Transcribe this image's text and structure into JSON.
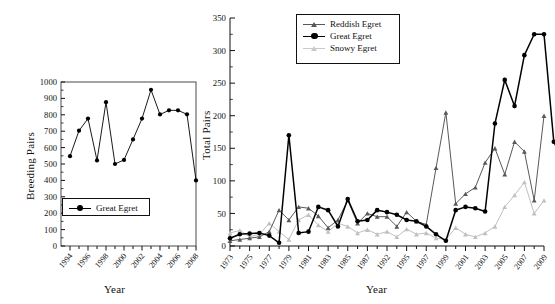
{
  "figure": {
    "background": "#ffffff"
  },
  "left_panel": {
    "ylabel": "Breeding Pairs",
    "xlabel": "Year",
    "legend": [
      {
        "label": "Great Egret",
        "color": "#000000",
        "marker": "circle"
      }
    ]
  },
  "right_panel": {
    "ylabel": "Total Pairs",
    "xlabel": "Year",
    "legend": [
      {
        "label": "Reddish Egret",
        "color": "#595959",
        "marker": "triangle"
      },
      {
        "label": "Great Egret",
        "color": "#000000",
        "marker": "circle"
      },
      {
        "label": "Snowy Egret",
        "color": "#c0c0c0",
        "marker": "triangle"
      }
    ]
  },
  "chart_data": [
    {
      "type": "line",
      "title": "",
      "xlabel": "Year",
      "ylabel": "Breeding Pairs",
      "ylim": [
        0,
        1000
      ],
      "ytick_step": 100,
      "yticks": [
        0,
        100,
        200,
        300,
        400,
        500,
        600,
        700,
        800,
        900,
        1000
      ],
      "xlim": [
        1993,
        2008
      ],
      "xticks": [
        1994,
        1995,
        1996,
        1997,
        1998,
        1999,
        2000,
        2001,
        2002,
        2003,
        2004,
        2005,
        2006,
        2007,
        2008
      ],
      "xtick_labels": [
        "1994",
        "",
        "1996",
        "",
        "1998",
        "",
        "2000",
        "",
        "2002",
        "",
        "2004",
        "",
        "2006",
        "",
        "2008"
      ],
      "grid": false,
      "legend_position": "lower-center-inside",
      "series": [
        {
          "name": "Great Egret",
          "color": "#000000",
          "marker": "circle",
          "x": [
            1994,
            1995,
            1996,
            1997,
            1998,
            1999,
            2000,
            2001,
            2002,
            2003,
            2004,
            2005,
            2006,
            2007,
            2008
          ],
          "values": [
            548,
            703,
            777,
            522,
            877,
            500,
            525,
            650,
            777,
            952,
            802,
            827,
            827,
            803,
            400
          ]
        }
      ]
    },
    {
      "type": "line",
      "title": "",
      "xlabel": "Year",
      "ylabel": "Total Pairs",
      "ylim": [
        0,
        350
      ],
      "ytick_step": 50,
      "yticks": [
        0,
        50,
        100,
        150,
        200,
        250,
        300,
        350
      ],
      "grid": false,
      "legend_position": "upper-center-inside",
      "xtick_labels": [
        "1973",
        "1975",
        "1977",
        "1979",
        "1981",
        "1983",
        "1985",
        "1987",
        "1992",
        "1995",
        "1997",
        "1999",
        "2001",
        "2003",
        "2005",
        "2007",
        "2009"
      ],
      "x": [
        "1973",
        "1974",
        "1975",
        "1976",
        "1977",
        "1978",
        "1979",
        "1980",
        "1981",
        "1982",
        "1983",
        "1984",
        "1985",
        "1986",
        "1987",
        "1988",
        "1992",
        "1993",
        "1995",
        "1996",
        "1997",
        "1998",
        "1999",
        "2000",
        "2001",
        "2002",
        "2003",
        "2004",
        "2005",
        "2006",
        "2007",
        "2008",
        "2009"
      ],
      "series": [
        {
          "name": "Reddish Egret",
          "color": "#595959",
          "marker": "triangle",
          "values": [
            8,
            10,
            12,
            14,
            22,
            55,
            40,
            60,
            58,
            46,
            28,
            40,
            70,
            35,
            50,
            45,
            45,
            30,
            52,
            38,
            33,
            120,
            205,
            65,
            80,
            90,
            128,
            150,
            110,
            160,
            145,
            70,
            200
          ]
        },
        {
          "name": "Great Egret",
          "color": "#000000",
          "marker": "circle",
          "values": [
            12,
            18,
            19,
            20,
            16,
            5,
            170,
            20,
            22,
            60,
            55,
            30,
            72,
            38,
            40,
            55,
            52,
            48,
            40,
            38,
            30,
            18,
            8,
            55,
            60,
            58,
            53,
            188,
            255,
            215,
            293,
            325,
            325
          ],
          "tail_values": [
            160,
            128
          ]
        },
        {
          "name": "Snowy Egret",
          "color": "#c0c0c0",
          "marker": "triangle",
          "values": [
            20,
            24,
            14,
            18,
            35,
            22,
            10,
            40,
            48,
            32,
            22,
            35,
            30,
            20,
            25,
            18,
            22,
            14,
            26,
            18,
            20,
            12,
            10,
            28,
            18,
            14,
            20,
            30,
            60,
            78,
            98,
            50,
            70
          ]
        }
      ]
    }
  ]
}
